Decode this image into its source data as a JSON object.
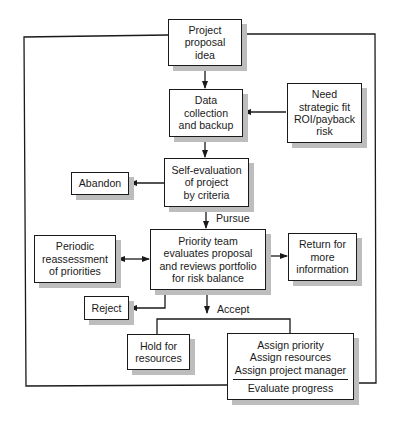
{
  "diagram": {
    "type": "flowchart",
    "nodes": {
      "proposal": [
        "Project",
        "proposal",
        "idea"
      ],
      "data": [
        "Data",
        "collection",
        "and backup"
      ],
      "need": [
        "Need",
        "strategic fit",
        "ROI/payback",
        "risk"
      ],
      "self_eval": [
        "Self-evaluation",
        "of project",
        "by criteria"
      ],
      "abandon": [
        "Abandon"
      ],
      "periodic": [
        "Periodic",
        "reassessment",
        "of priorities"
      ],
      "priority": [
        "Priority team",
        "evaluates proposal",
        "and reviews portfolio",
        "for risk balance"
      ],
      "return": [
        "Return for",
        "more",
        "information"
      ],
      "reject": [
        "Reject"
      ],
      "hold": [
        "Hold for",
        "resources"
      ],
      "assign": [
        "Assign priority",
        "Assign resources",
        "Assign project manager"
      ],
      "assign_footer": "Evaluate progress"
    },
    "edge_labels": {
      "pursue": "Pursue",
      "accept": "Accept"
    },
    "colors": {
      "line": "#1a1a1a",
      "shadow": "#bdbdbd",
      "background": "#ffffff"
    }
  }
}
